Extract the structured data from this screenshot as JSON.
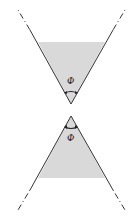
{
  "diagram": {
    "type": "double-cone",
    "colors": {
      "background": "#ffffff",
      "cone_fill": "#d9d9d9",
      "line": "#333333"
    },
    "top_cone": {
      "angle_label": "Φ",
      "apex": [
        71,
        104
      ],
      "fill_top_y": 42
    },
    "bottom_cone": {
      "angle_label": "Φ",
      "apex": [
        71,
        116
      ],
      "fill_bottom_y": 178
    }
  }
}
